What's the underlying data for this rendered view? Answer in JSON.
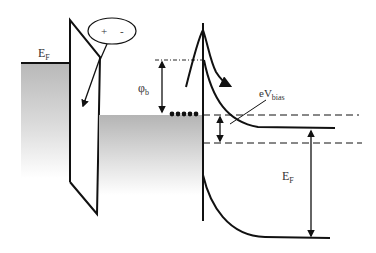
{
  "diagram": {
    "type": "band-diagram",
    "labels": {
      "metal_fermi": {
        "main": "E",
        "sub": "F"
      },
      "barrier_height": {
        "main": "φ",
        "sub": "b"
      },
      "bias": {
        "main": "eV",
        "sub": "bias"
      },
      "semiconductor_fermi": {
        "main": "E",
        "sub": "F"
      },
      "dipole_plus": "+",
      "dipole_minus": "-"
    },
    "colors": {
      "line": "#111111",
      "shade": "#b4b4b4",
      "text": "#333333"
    }
  }
}
